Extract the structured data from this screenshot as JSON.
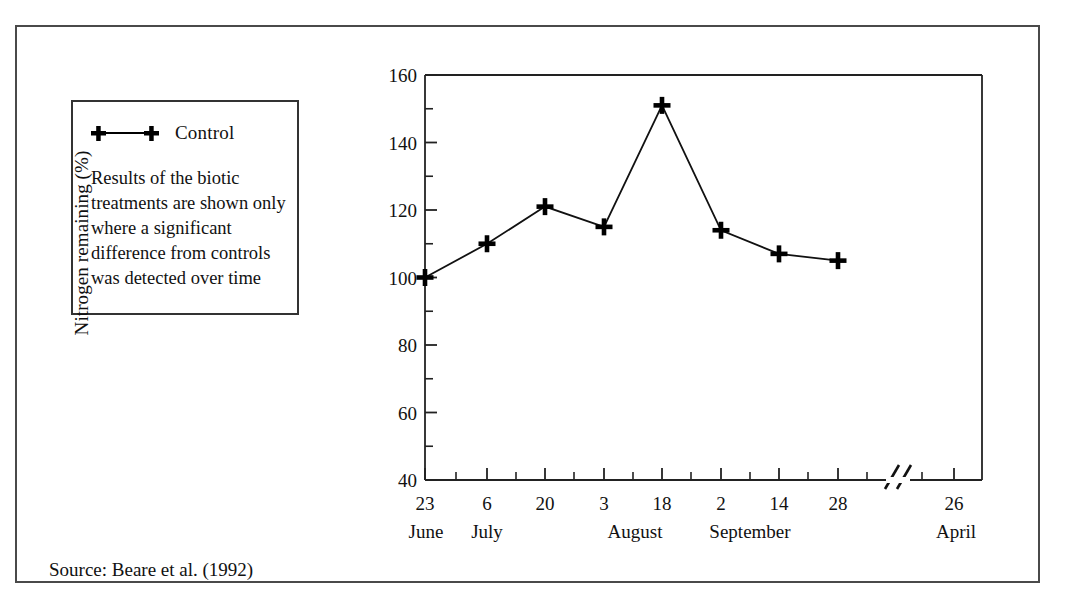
{
  "figure": {
    "source_note": "Source: Beare et al. (1992)"
  },
  "legend": {
    "series_label": "Control",
    "marker_icon": "plus-marker-icon",
    "note": "Results of the biotic treatments are shown only where a significant difference from controls was detected over time"
  },
  "chart_data": {
    "type": "line",
    "title": "",
    "xlabel": "",
    "ylabel": "Nitrogen remaining (%)",
    "ylim": [
      40,
      160
    ],
    "ytick_labels": [
      "40",
      "60",
      "80",
      "100",
      "120",
      "140",
      "160"
    ],
    "ytick_values": [
      40,
      60,
      80,
      100,
      120,
      140,
      160
    ],
    "yminor_step": 10,
    "grid": false,
    "legend_position": "outside-left",
    "axis_break": {
      "symbol": "//",
      "between": [
        "28 September",
        "26 April"
      ]
    },
    "categories": [
      "23 June",
      "6 July",
      "20 July",
      "3 August",
      "18 August",
      "2 September",
      "14 September",
      "28 September"
    ],
    "xtick_days": [
      "23",
      "6",
      "20",
      "3",
      "18",
      "2",
      "14",
      "28",
      "26"
    ],
    "xtick_months": [
      "June",
      "July",
      "August",
      "September",
      "April"
    ],
    "xtick_month_positions": [
      0,
      1,
      4,
      6,
      8
    ],
    "series": [
      {
        "name": "Control",
        "marker": "plus",
        "color": "#000000",
        "values": [
          100,
          110,
          121,
          115,
          151,
          114,
          107,
          105
        ]
      }
    ]
  }
}
